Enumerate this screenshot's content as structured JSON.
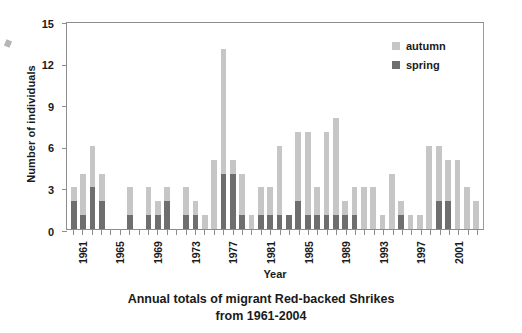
{
  "caption": {
    "line1": "Annual totals of migrant Red-backed Shrikes",
    "line2": "from 1961-2004"
  },
  "legend": {
    "autumn_label": "autumn",
    "spring_label": "spring",
    "autumn_color": "#c6c6c6",
    "spring_color": "#6e6e6e"
  },
  "axes": {
    "ylabel": "Number of individuals",
    "xlabel": "Year",
    "yticks": [
      0,
      3,
      6,
      9,
      12,
      15
    ],
    "xtick_labels": [
      "1961",
      "1965",
      "1969",
      "1973",
      "1977",
      "1981",
      "1985",
      "1989",
      "1993",
      "1997",
      "2001"
    ]
  },
  "chart_data": {
    "type": "bar",
    "title": "Annual totals of migrant Red-backed Shrikes from 1961-2004",
    "xlabel": "Year",
    "ylabel": "Number of individuals",
    "ylim": [
      0,
      15
    ],
    "ytick_step": 3,
    "grid": false,
    "stacked": true,
    "legend_position": "top-right",
    "legend": [
      "autumn",
      "spring"
    ],
    "categories": [
      "1961",
      "1962",
      "1963",
      "1964",
      "1965",
      "1966",
      "1967",
      "1968",
      "1969",
      "1970",
      "1971",
      "1972",
      "1973",
      "1974",
      "1975",
      "1976",
      "1977",
      "1978",
      "1979",
      "1980",
      "1981",
      "1982",
      "1983",
      "1984",
      "1985",
      "1986",
      "1987",
      "1988",
      "1989",
      "1990",
      "1991",
      "1992",
      "1993",
      "1994",
      "1995",
      "1996",
      "1997",
      "1998",
      "1999",
      "2000",
      "2001",
      "2002",
      "2003",
      "2004"
    ],
    "series": [
      {
        "name": "spring",
        "color": "#6e6e6e",
        "values": [
          2,
          1,
          3,
          2,
          0,
          0,
          1,
          0,
          1,
          1,
          2,
          0,
          1,
          1,
          0,
          0,
          4,
          4,
          1,
          0,
          1,
          1,
          1,
          1,
          2,
          1,
          1,
          1,
          1,
          1,
          1,
          0,
          0,
          0,
          0,
          1,
          0,
          0,
          0,
          2,
          2,
          0,
          0,
          0
        ]
      },
      {
        "name": "autumn",
        "color": "#c6c6c6",
        "values": [
          1,
          3,
          3,
          2,
          0,
          0,
          2,
          0,
          2,
          1,
          1,
          0,
          2,
          1,
          1,
          5,
          9,
          1,
          3,
          1,
          2,
          2,
          5,
          0,
          5,
          6,
          2,
          6,
          7,
          1,
          2,
          3,
          3,
          1,
          4,
          1,
          1,
          1,
          6,
          4,
          3,
          5,
          3,
          2
        ]
      }
    ],
    "totals": [
      3,
      4,
      6,
      4,
      0,
      0,
      3,
      0,
      3,
      2,
      3,
      0,
      3,
      2,
      1,
      5,
      13,
      5,
      4,
      1,
      3,
      3,
      6,
      1,
      7,
      7,
      3,
      7,
      8,
      2,
      3,
      3,
      3,
      1,
      4,
      2,
      1,
      1,
      6,
      6,
      5,
      5,
      3,
      2
    ]
  }
}
